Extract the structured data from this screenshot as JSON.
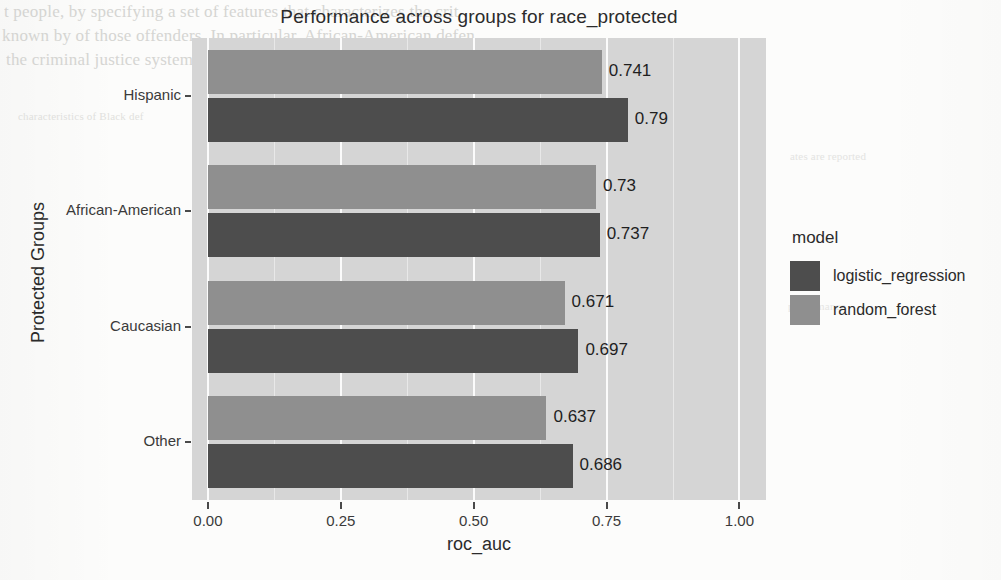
{
  "chart_data": {
    "type": "bar",
    "orientation": "horizontal",
    "title": "Performance across groups for race_protected",
    "xlabel": "roc_auc",
    "ylabel": "Protected Groups",
    "categories": [
      "Hispanic",
      "African-American",
      "Caucasian",
      "Other"
    ],
    "series": [
      {
        "name": "logistic_regression",
        "color": "#4d4d4d",
        "values": [
          0.79,
          0.737,
          0.697,
          0.686
        ],
        "labels": [
          "0.79",
          "0.737",
          "0.697",
          "0.686"
        ]
      },
      {
        "name": "random_forest",
        "color": "#8f8f8f",
        "values": [
          0.741,
          0.73,
          0.671,
          0.637
        ],
        "labels": [
          "0.741",
          "0.73",
          "0.671",
          "0.637"
        ]
      }
    ],
    "xlim": [
      -0.03,
      1.05
    ],
    "xticks": [
      0.0,
      0.25,
      0.5,
      0.75,
      1.0
    ],
    "xtick_labels": [
      "0.00",
      "0.25",
      "0.50",
      "0.75",
      "1.00"
    ],
    "grid": true,
    "panel_background": "#d5d5d5",
    "legend": {
      "title": "model",
      "position": "right",
      "entries": [
        {
          "label": "logistic_regression",
          "color": "#4d4d4d"
        },
        {
          "label": "random_forest",
          "color": "#8f8f8f"
        }
      ]
    }
  },
  "ghost_text": {
    "line1": "t people, by specifying a set of features that characterizes the crit",
    "line2": "known by of those offenders. In particular, African-American defen",
    "line3": "the criminal justice system than Caucasian defendants. First, we look",
    "line4": "characteristics of Black def",
    "line5": "ates are reported",
    "line6": "performance"
  }
}
